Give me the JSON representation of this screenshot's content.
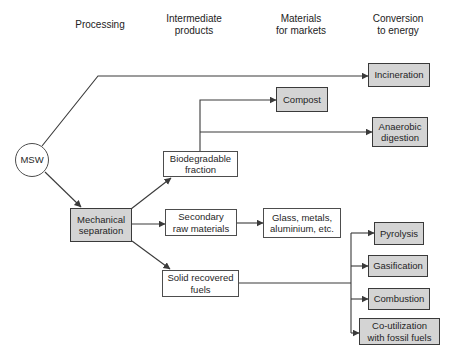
{
  "diagram": {
    "type": "flowchart",
    "columns": {
      "processing": "Processing",
      "intermediate": "Intermediate\nproducts",
      "materials": "Materials\nfor markets",
      "conversion": "Conversion\nto energy"
    },
    "nodes": {
      "msw": "MSW",
      "mechanical_separation": "Mechanical\nseparation",
      "biodegradable_fraction": "Biodegradable\nfraction",
      "secondary_raw_materials": "Secondary\nraw materials",
      "solid_recovered_fuels": "Solid recovered\nfuels",
      "glass_metals": "Glass, metals,\naluminium, etc.",
      "compost": "Compost",
      "incineration": "Incineration",
      "anaerobic_digestion": "Anaerobic\ndigestion",
      "pyrolysis": "Pyrolysis",
      "gasification": "Gasification",
      "combustion": "Combustion",
      "co_utilization": "Co-utilization\nwith fossil fuels"
    },
    "edges": [
      "MSW -> Incineration",
      "MSW -> Mechanical separation",
      "Mechanical separation -> Biodegradable fraction",
      "Mechanical separation -> Secondary raw materials",
      "Mechanical separation -> Solid recovered fuels",
      "Secondary raw materials -> Glass, metals, aluminium, etc.",
      "Biodegradable fraction -> Compost",
      "Biodegradable fraction -> Anaerobic digestion",
      "Solid recovered fuels -> Pyrolysis",
      "Solid recovered fuels -> Gasification",
      "Solid recovered fuels -> Combustion",
      "Solid recovered fuels -> Co-utilization with fossil fuels"
    ],
    "colors": {
      "background": "#ffffff",
      "node_plain_fill": "#ffffff",
      "node_shaded_fill": "#d4d4d4",
      "border": "#3a3a3a",
      "connector": "#3a3a3a",
      "text": "#1f1f1f"
    }
  }
}
